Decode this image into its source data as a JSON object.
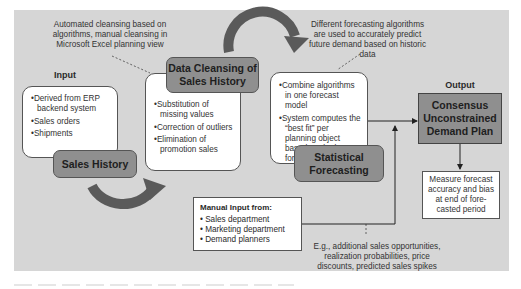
{
  "notes": {
    "cleansing": "Automated cleansing based on algorithms, manual cleansing in Microsoft Excel planning view",
    "forecasting": "Different forecasting algorithms are used to accurately predict future demand based on historic data",
    "examples": "E.g., additional sales opportunities, realization probabilities, price discounts, predicted sales spikes"
  },
  "input": {
    "heading": "Input",
    "items": [
      "Derived from ERP backend system",
      "Sales orders",
      "Shipments"
    ],
    "stage": "Sales History"
  },
  "cleansing": {
    "stage": "Data Cleansing of Sales History",
    "items": [
      "Substitution of missing values",
      "Correction of outliers",
      "Elimination of promotion sales"
    ]
  },
  "forecasting": {
    "stage": "Statistical Forecasting",
    "items": [
      "Combine algorithms in one forecast model",
      "System computes the “best fit” per planning object based on the best forecast error"
    ]
  },
  "manual_input": {
    "heading": "Manual Input from:",
    "items": [
      "Sales department",
      "Marketing department",
      "Demand planners"
    ]
  },
  "output": {
    "heading": "Output",
    "title": "Consensus Unconstrained Demand Plan",
    "measure": "Measure forecast accuracy and bias at end of fore-casted period"
  },
  "colors": {
    "panel": "#d6d6d6",
    "stage": "#8f8f8f",
    "arrow": "#5a5a5a"
  }
}
